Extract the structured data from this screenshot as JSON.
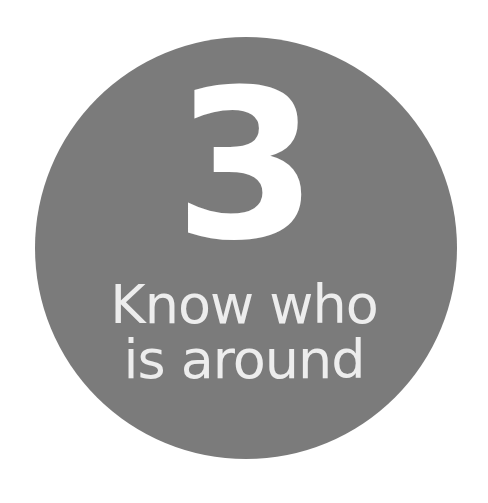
{
  "badge": {
    "number": "3",
    "caption_line1": "Know who",
    "caption_line2": "is around",
    "background_color": "#7b7b7b",
    "text_color": "#ffffff"
  }
}
